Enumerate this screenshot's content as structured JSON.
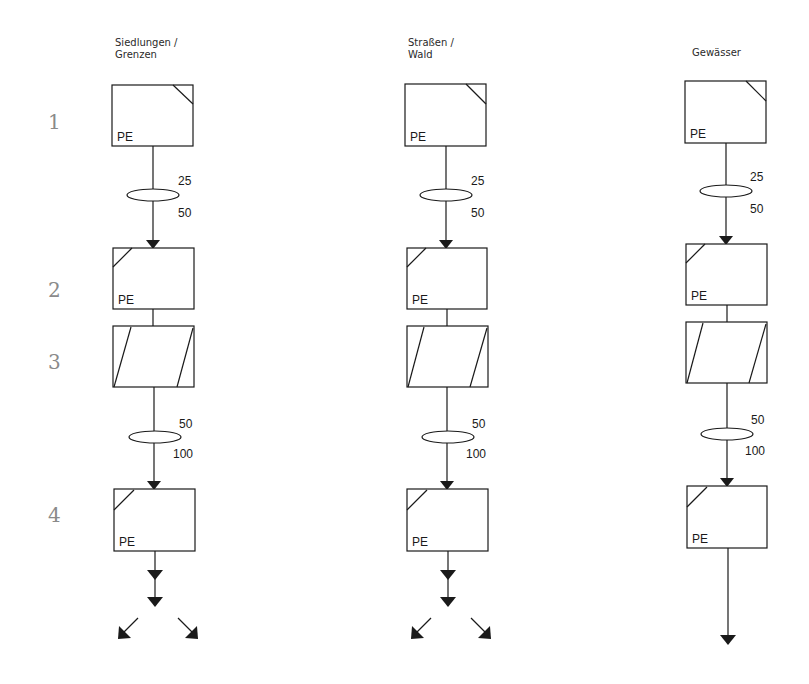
{
  "diagram": {
    "row_numbers": [
      "1",
      "2",
      "3",
      "4"
    ],
    "columns": [
      {
        "title_lines": [
          "Siedlungen /",
          "Grenzen"
        ],
        "boxes": [
          {
            "step": "1",
            "label": "PE",
            "corner": "top-right"
          },
          {
            "step": "2",
            "label": "PE",
            "corner": "top-left"
          },
          {
            "step": "3",
            "label": "",
            "corner": "parallelogram"
          },
          {
            "step": "4",
            "label": "PE",
            "corner": "top-left"
          }
        ],
        "filter_1": {
          "upper": "25",
          "lower": "50"
        },
        "filter_2": {
          "upper": "50",
          "lower": "100"
        },
        "output": "split"
      },
      {
        "title_lines": [
          "Straßen /",
          "Wald"
        ],
        "boxes": [
          {
            "step": "1",
            "label": "PE",
            "corner": "top-right"
          },
          {
            "step": "2",
            "label": "PE",
            "corner": "top-left"
          },
          {
            "step": "3",
            "label": "",
            "corner": "parallelogram"
          },
          {
            "step": "4",
            "label": "PE",
            "corner": "top-left"
          }
        ],
        "filter_1": {
          "upper": "25",
          "lower": "50"
        },
        "filter_2": {
          "upper": "50",
          "lower": "100"
        },
        "output": "split"
      },
      {
        "title_lines": [
          "Gewässer"
        ],
        "boxes": [
          {
            "step": "1",
            "label": "PE",
            "corner": "top-right"
          },
          {
            "step": "2",
            "label": "PE",
            "corner": "top-left"
          },
          {
            "step": "3",
            "label": "",
            "corner": "parallelogram"
          },
          {
            "step": "4",
            "label": "PE",
            "corner": "top-left"
          }
        ],
        "filter_1": {
          "upper": "25",
          "lower": "50"
        },
        "filter_2": {
          "upper": "50",
          "lower": "100"
        },
        "output": "single"
      }
    ]
  }
}
